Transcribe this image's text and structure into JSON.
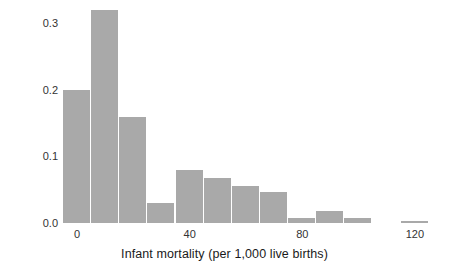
{
  "chart_data": {
    "type": "bar",
    "title": "",
    "xlabel": "Infant mortality (per 1,000 live births)",
    "ylabel": "Proportion",
    "xlim": [
      -5,
      130
    ],
    "ylim": [
      0.0,
      0.335
    ],
    "grid": false,
    "legend": null,
    "bar_color": "#a9a9a9",
    "bin_width": 10,
    "xticks": [
      {
        "value": 0,
        "label": "0"
      },
      {
        "value": 40,
        "label": "40"
      },
      {
        "value": 80,
        "label": "80"
      },
      {
        "value": 120,
        "label": "120"
      }
    ],
    "yticks": [
      {
        "value": 0.0,
        "label": "0.0"
      },
      {
        "value": 0.1,
        "label": "0.1"
      },
      {
        "value": 0.2,
        "label": "0.2"
      },
      {
        "value": 0.3,
        "label": "0.3"
      }
    ],
    "bins": [
      {
        "x0": -5,
        "x1": 5,
        "center": 0,
        "value": 0.2
      },
      {
        "x0": 5,
        "x1": 15,
        "center": 10,
        "value": 0.32
      },
      {
        "x0": 15,
        "x1": 25,
        "center": 20,
        "value": 0.16
      },
      {
        "x0": 25,
        "x1": 35,
        "center": 30,
        "value": 0.03
      },
      {
        "x0": 35,
        "x1": 45,
        "center": 40,
        "value": 0.08
      },
      {
        "x0": 45,
        "x1": 55,
        "center": 50,
        "value": 0.068
      },
      {
        "x0": 55,
        "x1": 65,
        "center": 60,
        "value": 0.055
      },
      {
        "x0": 65,
        "x1": 75,
        "center": 70,
        "value": 0.047
      },
      {
        "x0": 75,
        "x1": 85,
        "center": 80,
        "value": 0.008
      },
      {
        "x0": 85,
        "x1": 95,
        "center": 90,
        "value": 0.018
      },
      {
        "x0": 95,
        "x1": 105,
        "center": 100,
        "value": 0.008
      },
      {
        "x0": 115,
        "x1": 125,
        "center": 120,
        "value": 0.003
      }
    ],
    "categories": [
      "0",
      "10",
      "20",
      "30",
      "40",
      "50",
      "60",
      "70",
      "80",
      "90",
      "100",
      "120"
    ],
    "values": [
      0.2,
      0.32,
      0.16,
      0.03,
      0.08,
      0.068,
      0.055,
      0.047,
      0.008,
      0.018,
      0.008,
      0.003
    ]
  }
}
